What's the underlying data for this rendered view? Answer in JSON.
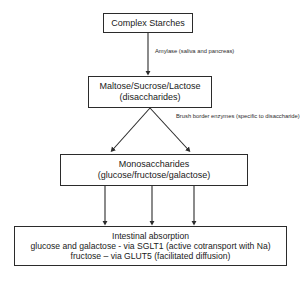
{
  "diagram": {
    "nodes": {
      "starches": {
        "lines": [
          "Complex Starches"
        ]
      },
      "disaccharides": {
        "lines": [
          "Maltose/Sucrose/Lactose",
          "(disaccharides)"
        ]
      },
      "monosaccharides": {
        "lines": [
          "Monosaccharides",
          "(glucose/fructose/galactose)"
        ]
      },
      "absorption": {
        "lines": [
          "Intestinal absorption",
          "glucose and galactose - via SGLT1 (active cotransport with Na)",
          "fructose – via GLUT5 (facilitated diffusion)"
        ]
      }
    },
    "edge_labels": {
      "amylase": [
        "Amylase (saliva and pancreas)"
      ],
      "brush_border": [
        "Brush border enzymes",
        "(specific to disaccharide)"
      ]
    },
    "colors": {
      "stroke": "#2b2b2b",
      "background": "#ffffff",
      "text": "#1a1a1a"
    }
  }
}
